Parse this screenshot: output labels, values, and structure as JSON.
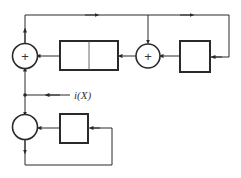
{
  "diagram": {
    "type": "block-diagram",
    "colors": {
      "stroke": "#2a2a2a",
      "background": "#ffffff"
    },
    "nodes": [
      {
        "id": "adder-left",
        "kind": "summing-junction",
        "symbol": "+"
      },
      {
        "id": "register-split",
        "kind": "block",
        "sections": 2
      },
      {
        "id": "adder-middle",
        "kind": "summing-junction",
        "symbol": "+"
      },
      {
        "id": "block-right",
        "kind": "block"
      },
      {
        "id": "adder-bottom",
        "kind": "summing-junction",
        "symbol": ""
      },
      {
        "id": "block-bottom",
        "kind": "block"
      }
    ],
    "labels": {
      "input": "i(X)",
      "plus_symbol": "+"
    },
    "edges": [
      {
        "from": "adder-left",
        "to": "top-bus"
      },
      {
        "from": "top-bus",
        "to": "adder-middle"
      },
      {
        "from": "top-bus",
        "to": "block-right"
      },
      {
        "from": "block-right",
        "to": "adder-middle"
      },
      {
        "from": "adder-middle",
        "to": "register-split"
      },
      {
        "from": "register-split",
        "to": "adder-left"
      },
      {
        "from": "input-i(X)",
        "to": "tap-junction"
      },
      {
        "from": "tap-junction",
        "to": "adder-left"
      },
      {
        "from": "tap-junction",
        "to": "adder-bottom"
      },
      {
        "from": "block-bottom",
        "to": "adder-bottom"
      },
      {
        "from": "adder-bottom",
        "to": "block-bottom",
        "via": "feedback-loop"
      }
    ]
  }
}
